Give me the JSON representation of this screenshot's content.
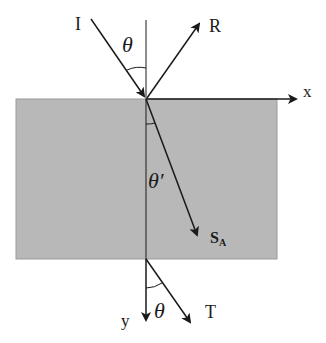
{
  "diagram": {
    "colors": {
      "slab_fill": "#b8b8b8",
      "line": "#1a1a1a",
      "background": "#ffffff"
    },
    "labels": {
      "incident": "I",
      "reflected": "R",
      "x_axis": "x",
      "y_axis": "y",
      "angle_incident": "θ",
      "angle_refracted": "θ′",
      "poynting_main": "S",
      "poynting_sub": "A",
      "transmitted": "T",
      "angle_transmitted": "θ"
    }
  }
}
